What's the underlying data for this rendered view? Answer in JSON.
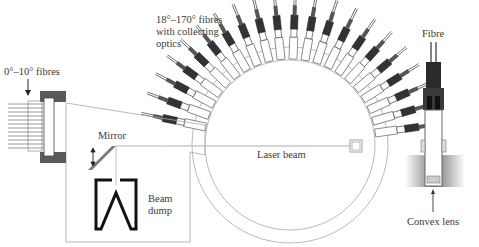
{
  "labels": {
    "fibres_0_10": "0°–10° fibres",
    "fibres_18_170_line1": "18°–170° fibres",
    "fibres_18_170_line2": "with collecting",
    "fibres_18_170_line3": "optics",
    "mirror": "Mirror",
    "laser_beam": "Laser beam",
    "beam_dump_line1": "Beam",
    "beam_dump_line2": "dump",
    "fibre": "Fibre",
    "convex_lens": "Convex lens"
  },
  "geometry": {
    "chamber_center": [
      290,
      145
    ],
    "chamber_inner_radius": 85,
    "chamber_outer_radius": 98,
    "fibre_count_arc": 22,
    "fibre_arc_range_deg": [
      18,
      170
    ],
    "forward_fibre_count": 12
  },
  "colors": {
    "line": "#9a9a9a",
    "dark": "#1a1a1a",
    "block": "#5a5a5a",
    "mirror": "#7a7a7a"
  }
}
